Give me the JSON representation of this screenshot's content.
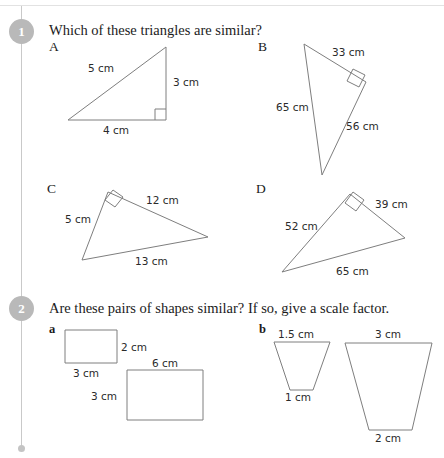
{
  "page": {
    "width": 444,
    "height": 458,
    "line_color": "#7e7e7e",
    "badge_color": "#b9b9b9",
    "spine_color": "#c9c9c9"
  },
  "questions": [
    {
      "number": "1",
      "prompt": "Which of these triangles are similar?",
      "shapes": [
        {
          "letter": "A",
          "type": "right-triangle",
          "labels": [
            "5 cm",
            "3 cm",
            "4 cm"
          ]
        },
        {
          "letter": "B",
          "type": "right-triangle",
          "labels": [
            "33 cm",
            "65 cm",
            "56 cm"
          ]
        },
        {
          "letter": "C",
          "type": "right-triangle",
          "labels": [
            "12 cm",
            "5 cm",
            "13 cm"
          ]
        },
        {
          "letter": "D",
          "type": "right-triangle",
          "labels": [
            "39 cm",
            "52 cm",
            "65 cm"
          ]
        }
      ]
    },
    {
      "number": "2",
      "prompt": "Are these pairs of shapes similar? If so, give a scale factor.",
      "parts": [
        {
          "letter": "a",
          "shapes": [
            {
              "type": "rectangle",
              "labels": [
                "2 cm",
                "3 cm"
              ]
            },
            {
              "type": "rectangle",
              "labels": [
                "6 cm",
                "3 cm"
              ]
            }
          ]
        },
        {
          "letter": "b",
          "shapes": [
            {
              "type": "trapezium",
              "labels": [
                "1.5 cm",
                "1 cm"
              ]
            },
            {
              "type": "trapezium",
              "labels": [
                "3 cm",
                "2 cm"
              ]
            }
          ]
        }
      ]
    }
  ],
  "labels": {
    "q1_badge": "1",
    "q1_prompt": "Which of these triangles are similar?",
    "letter_a": "A",
    "letter_b": "B",
    "letter_c": "C",
    "letter_d": "D",
    "a_side_hyp": "5 cm",
    "a_side_vert": "3 cm",
    "a_side_base": "4 cm",
    "b_side_top": "33 cm",
    "b_side_left": "65 cm",
    "b_side_right": "56 cm",
    "c_side_top": "12 cm",
    "c_side_left": "5 cm",
    "c_side_base": "13 cm",
    "d_side_top": "39 cm",
    "d_side_left": "52 cm",
    "d_side_base": "65 cm",
    "q2_badge": "2",
    "q2_prompt": "Are these pairs of shapes similar? If so, give a scale factor.",
    "part_a": "a",
    "part_b": "b",
    "a_small_height": "2 cm",
    "a_small_width": "3 cm",
    "a_large_width": "6 cm",
    "a_large_height": "3 cm",
    "b_small_top": "1.5 cm",
    "b_small_bottom": "1 cm",
    "b_large_top": "3 cm",
    "b_large_bottom": "2 cm"
  }
}
